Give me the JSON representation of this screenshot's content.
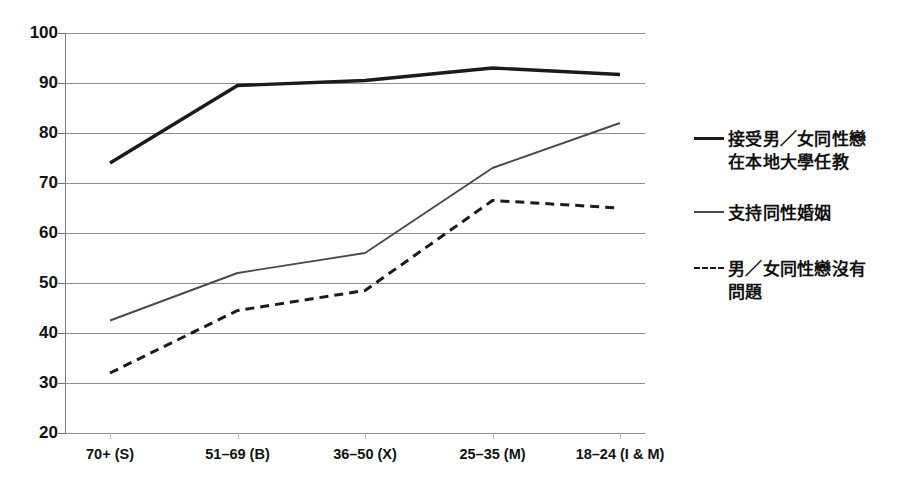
{
  "chart_data": {
    "type": "line",
    "title": "",
    "xlabel": "",
    "ylabel": "",
    "ylim": [
      20,
      100
    ],
    "ytick_step": 10,
    "grid": true,
    "legend_position": "right",
    "categories": [
      "70+ (S)",
      "51–69 (B)",
      "36–50 (X)",
      "25–35 (M)",
      "18–24 (I & M)"
    ],
    "ytick_labels": [
      "100",
      "90",
      "80",
      "70",
      "60",
      "50",
      "40",
      "30",
      "20"
    ],
    "ytick_values": [
      100,
      90,
      80,
      70,
      60,
      50,
      40,
      30,
      20
    ],
    "series": [
      {
        "name": "接受男／女同性戀在本地大學任教",
        "legend_line1": "接受男／女同性戀",
        "legend_line2": "在本地大學任教",
        "style": "solid-thick",
        "color": "#1b1b1b",
        "values": [
          74,
          89.5,
          90.5,
          93,
          91.7
        ]
      },
      {
        "name": "支持同性婚姻",
        "legend_line1": "支持同性婚姻",
        "legend_line2": "",
        "style": "solid-thin",
        "color": "#4a4a4a",
        "values": [
          42.5,
          52,
          56,
          73,
          82
        ]
      },
      {
        "name": "男／女同性戀沒有問題",
        "legend_line1": "男／女同性戀沒有",
        "legend_line2": "問題",
        "style": "dashed",
        "color": "#1b1b1b",
        "values": [
          32,
          44.5,
          48.5,
          66.5,
          65
        ]
      }
    ]
  }
}
